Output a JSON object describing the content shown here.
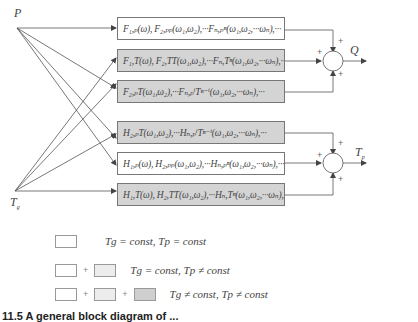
{
  "inputs": {
    "p_label": "P",
    "tg_label": "T",
    "tg_sub": "g"
  },
  "outputs": {
    "q_label": "Q",
    "tp_label": "T",
    "tp_sub": "p"
  },
  "boxes": [
    {
      "id": "F1",
      "shade": "white",
      "text": "F₁,ₚ(ω), F₂,ₚₚ(ω₁,ω₂),···Fₙ,ₚⁿ(ω₁,ω₂,···ωₙ),···"
    },
    {
      "id": "F2",
      "shade": "gray",
      "text": "F₁,T(ω), F₂,TT(ω₁,ω₂),···Fₙ,Tⁿ(ω₁,ω₂,···ωₙ),···"
    },
    {
      "id": "F3",
      "shade": "gray",
      "text": "F₂,ₚT(ω₁,ω₂),···Fₙ,ₚⁱTⁿ⁻ⁱ(ω₁,ω₂,···ωₙ),···"
    },
    {
      "id": "H1",
      "shade": "gray",
      "text": "H₂,ₚT(ω₁,ω₂),···Hₙ,ₚⁱTⁿ⁻ⁱ(ω₁,ω₂,···ωₙ),···"
    },
    {
      "id": "H2",
      "shade": "white",
      "text": "H₁,ₚ(ω), H₂,ₚₚ(ω₁,ω₂),···Hₙ,ₚⁿ(ω₁,ω₂,···ωₙ),···"
    },
    {
      "id": "H3",
      "shade": "gray",
      "text": "H₁,T(ω), H₂,TT(ω₁,ω₂),···Hₙ,Tⁿ(ω₁,ω₂,···ωₙ),···"
    }
  ],
  "summers": {
    "plus_sign": "+"
  },
  "legend": [
    {
      "boxes": [
        "white"
      ],
      "text": "Tg = const, Tp = const"
    },
    {
      "boxes": [
        "white",
        "light"
      ],
      "text": "Tg = const, Tp ≠ const"
    },
    {
      "boxes": [
        "white",
        "light",
        "dark"
      ],
      "text": "Tg ≠ const, Tp ≠ const"
    }
  ],
  "legend_plus": "+",
  "caption": "11.5  A general block diagram of ..."
}
